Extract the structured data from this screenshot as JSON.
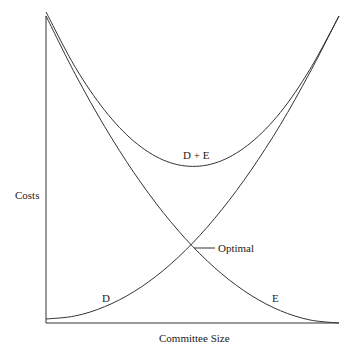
{
  "chart_data": {
    "type": "line",
    "title": "",
    "xlabel": "Committee Size",
    "ylabel": "Costs",
    "x": [
      0,
      0.1,
      0.2,
      0.3,
      0.4,
      0.5,
      0.6,
      0.7,
      0.8,
      0.9,
      1.0
    ],
    "series": [
      {
        "name": "D",
        "values": [
          0.013,
          0.023,
          0.053,
          0.102,
          0.171,
          0.26,
          0.369,
          0.498,
          0.646,
          0.815,
          1.0
        ]
      },
      {
        "name": "E",
        "values": [
          1.0,
          0.81,
          0.64,
          0.49,
          0.36,
          0.25,
          0.16,
          0.09,
          0.04,
          0.01,
          0.0
        ]
      },
      {
        "name": "D + E",
        "values": [
          1.013,
          0.833,
          0.693,
          0.592,
          0.531,
          0.51,
          0.529,
          0.588,
          0.686,
          0.825,
          1.0
        ]
      }
    ],
    "annotations": [
      {
        "text": "Optimal",
        "x": 0.5,
        "y": 0.25,
        "leader_line": true
      }
    ],
    "axis_ticks": "none",
    "grid": false,
    "legend": "inline labels"
  },
  "labels": {
    "ylabel": "Costs",
    "xlabel": "Committee Size",
    "sum_curve": "D + E",
    "d_curve": "D",
    "e_curve": "E",
    "optimal": "Optimal"
  },
  "colors": {
    "line": "#333333",
    "background": "#ffffff"
  }
}
